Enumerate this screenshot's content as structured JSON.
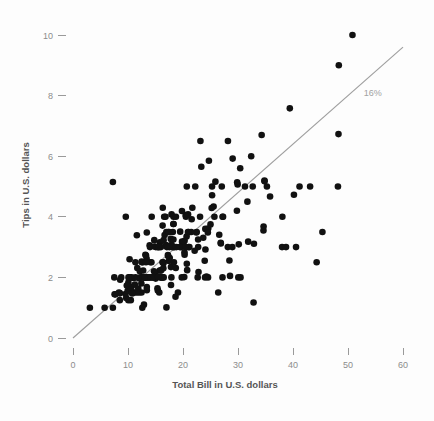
{
  "chart_data": {
    "type": "scatter",
    "title": "",
    "subtitle": "",
    "xlabel": "Total Bill in U.S. dollars",
    "ylabel": "Tips in U.S. dollars",
    "xlim": [
      0,
      62
    ],
    "ylim": [
      0,
      10.6
    ],
    "grid": false,
    "legend": null,
    "xticks": [
      0,
      10,
      20,
      30,
      40,
      50,
      60
    ],
    "xtick_labels": [
      "0",
      "10",
      "20",
      "30",
      "40",
      "50",
      "60"
    ],
    "yticks": [
      0,
      2,
      4,
      6,
      8,
      10
    ],
    "ytick_labels": [
      "0",
      "2",
      "4",
      "6",
      "8",
      "10"
    ],
    "annotations": [
      {
        "text": "16%",
        "x": 54.5,
        "y": 8.0,
        "color": "#a2a2a2",
        "describes": "reference-line-label"
      }
    ],
    "reference_line": {
      "label": "16%",
      "slope": 0.16,
      "intercept": 0,
      "x_start": 0,
      "y_start": 0,
      "x_end": 60,
      "y_end": 9.6,
      "color": "#9e9e9e"
    },
    "series": [
      {
        "name": "tips",
        "marker": "circle",
        "color": "#111111",
        "marker_size": 3.3,
        "x": [
          16.99,
          10.34,
          21.01,
          23.68,
          24.59,
          25.29,
          8.77,
          26.88,
          15.04,
          14.78,
          10.27,
          35.26,
          15.42,
          18.43,
          14.83,
          21.58,
          10.33,
          16.29,
          16.97,
          20.65,
          17.92,
          20.29,
          15.77,
          39.42,
          19.82,
          17.81,
          13.37,
          12.69,
          21.7,
          19.65,
          9.55,
          18.35,
          15.06,
          20.69,
          17.78,
          24.06,
          16.31,
          16.93,
          18.69,
          31.27,
          16.04,
          17.46,
          13.94,
          9.68,
          30.4,
          18.29,
          22.23,
          32.4,
          28.55,
          18.04,
          12.54,
          10.29,
          34.81,
          9.94,
          25.56,
          19.49,
          38.01,
          26.41,
          11.24,
          48.27,
          20.29,
          13.81,
          11.02,
          18.29,
          17.59,
          20.08,
          16.45,
          3.07,
          20.23,
          15.01,
          12.02,
          17.07,
          26.86,
          25.28,
          14.73,
          10.51,
          17.92,
          27.2,
          22.76,
          17.29,
          19.44,
          16.66,
          10.07,
          32.68,
          15.98,
          34.83,
          13.03,
          18.28,
          24.71,
          21.16,
          28.97,
          22.49,
          5.75,
          16.32,
          22.75,
          40.17,
          27.28,
          12.03,
          21.01,
          12.46,
          11.35,
          15.38,
          44.3,
          22.42,
          20.92,
          15.36,
          20.49,
          25.21,
          18.24,
          14.31,
          14.0,
          7.25,
          38.07,
          23.95,
          25.71,
          17.31,
          29.93,
          10.65,
          12.43,
          24.08,
          11.69,
          13.42,
          14.26,
          15.95,
          12.48,
          29.8,
          8.52,
          14.52,
          11.38,
          22.82,
          19.08,
          20.27,
          11.17,
          12.26,
          18.26,
          8.51,
          10.33,
          14.15,
          16.0,
          13.16,
          17.47,
          34.3,
          41.19,
          27.05,
          16.43,
          8.35,
          18.64,
          11.87,
          9.78,
          7.51,
          14.07,
          13.13,
          17.26,
          24.55,
          19.77,
          29.85,
          48.17,
          25.0,
          13.39,
          16.49,
          21.5,
          12.66,
          16.21,
          13.81,
          17.51,
          24.52,
          20.76,
          31.71,
          10.59,
          10.63,
          50.81,
          15.81,
          7.25,
          31.85,
          16.82,
          32.9,
          17.89,
          14.48,
          9.6,
          34.63,
          34.65,
          23.33,
          45.35,
          23.17,
          40.55,
          20.69,
          20.9,
          30.46,
          18.15,
          23.1,
          15.69,
          19.81,
          28.44,
          15.48,
          16.58,
          7.56,
          10.34,
          43.11,
          13.0,
          13.51,
          18.71,
          12.74,
          13.0,
          16.4,
          20.53,
          16.47,
          26.59,
          38.73,
          24.27,
          12.76,
          30.06,
          25.89,
          48.33,
          13.27,
          28.17,
          12.9,
          28.15,
          11.59,
          7.74,
          30.14,
          12.16,
          13.42,
          8.58,
          15.98,
          13.42,
          16.27,
          10.09,
          20.45,
          13.28,
          22.12,
          24.01,
          15.69,
          11.61,
          10.77,
          15.53,
          10.07,
          12.6,
          32.83,
          35.83,
          29.03,
          27.18,
          22.67,
          17.82,
          18.78
        ],
        "y": [
          1.01,
          1.66,
          3.5,
          3.31,
          3.61,
          4.71,
          2.0,
          3.12,
          1.96,
          3.23,
          1.71,
          5.0,
          1.57,
          3.0,
          3.02,
          3.92,
          1.67,
          3.71,
          3.5,
          3.35,
          4.08,
          2.75,
          2.23,
          7.58,
          3.18,
          2.34,
          2.0,
          2.0,
          4.3,
          3.0,
          1.45,
          2.5,
          3.0,
          2.45,
          3.27,
          3.6,
          2.0,
          3.07,
          2.31,
          5.0,
          2.24,
          2.54,
          3.06,
          1.32,
          5.6,
          3.0,
          5.0,
          6.0,
          2.05,
          3.0,
          2.5,
          2.6,
          5.2,
          1.56,
          4.34,
          3.51,
          3.0,
          1.5,
          1.76,
          6.73,
          3.21,
          2.0,
          1.98,
          3.76,
          2.64,
          3.15,
          2.47,
          1.0,
          2.01,
          2.09,
          1.97,
          3.0,
          3.14,
          5.0,
          2.2,
          1.25,
          3.08,
          4.0,
          3.0,
          2.71,
          3.0,
          3.4,
          1.83,
          5.0,
          2.03,
          5.17,
          2.0,
          4.0,
          5.85,
          3.0,
          3.0,
          3.5,
          1.0,
          4.3,
          3.25,
          4.73,
          4.0,
          1.5,
          3.0,
          1.5,
          2.5,
          3.0,
          2.5,
          3.48,
          4.08,
          1.64,
          4.06,
          4.29,
          3.76,
          4.0,
          3.0,
          1.0,
          4.0,
          2.55,
          4.0,
          3.5,
          5.07,
          1.5,
          1.8,
          2.92,
          2.31,
          1.68,
          2.5,
          2.0,
          2.52,
          4.2,
          1.48,
          2.0,
          2.0,
          2.18,
          1.5,
          2.83,
          1.5,
          2.0,
          3.25,
          1.25,
          2.0,
          2.0,
          2.0,
          2.75,
          3.5,
          6.7,
          5.0,
          5.0,
          2.3,
          1.5,
          1.36,
          1.63,
          1.73,
          2.0,
          2.5,
          2.0,
          2.74,
          2.0,
          2.0,
          5.14,
          5.0,
          3.75,
          2.61,
          2.0,
          3.5,
          2.5,
          2.0,
          2.0,
          3.0,
          3.48,
          2.24,
          4.5,
          1.61,
          2.0,
          10.0,
          3.16,
          5.15,
          3.18,
          4.0,
          3.11,
          2.0,
          2.0,
          4.0,
          3.55,
          3.68,
          5.65,
          3.5,
          6.5,
          3.0,
          5.0,
          3.5,
          2.0,
          3.5,
          4.0,
          1.5,
          4.19,
          2.56,
          2.02,
          4.0,
          1.44,
          2.0,
          5.0,
          2.0,
          2.0,
          4.0,
          2.01,
          2.0,
          2.5,
          4.0,
          3.23,
          3.41,
          3.0,
          2.03,
          2.23,
          2.0,
          5.16,
          9.0,
          2.5,
          6.5,
          1.1,
          3.0,
          1.5,
          1.44,
          3.09,
          2.2,
          3.48,
          1.92,
          3.0,
          1.58,
          2.5,
          2.0,
          3.0,
          2.72,
          2.88,
          2.0,
          3.0,
          3.39,
          1.47,
          3.0,
          1.25,
          1.0,
          1.17,
          4.67,
          5.92,
          2.0,
          2.0,
          1.75,
          3.0
        ]
      }
    ]
  },
  "figure": {
    "background_color": "#fdfdfd",
    "point_color": "#111111",
    "line_color": "#9e9e9e",
    "tick_color": "#9a9a9a",
    "tick_label_color": "#8c8c8c",
    "axis_title_color": "#555555"
  }
}
